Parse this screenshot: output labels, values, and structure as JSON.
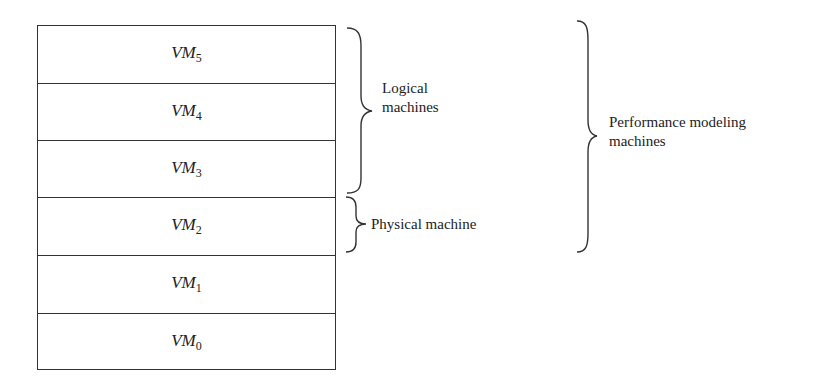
{
  "diagram": {
    "type": "layered-stack",
    "layers": [
      {
        "base": "VM",
        "sub": "5"
      },
      {
        "base": "VM",
        "sub": "4"
      },
      {
        "base": "VM",
        "sub": "3"
      },
      {
        "base": "VM",
        "sub": "2"
      },
      {
        "base": "VM",
        "sub": "1"
      },
      {
        "base": "VM",
        "sub": "0"
      }
    ],
    "groups": {
      "logical": {
        "line1": "Logical",
        "line2": "machines",
        "spans": [
          "VM5",
          "VM4",
          "VM3"
        ]
      },
      "physical": {
        "label": "Physical machine",
        "spans": [
          "VM2"
        ]
      },
      "performance": {
        "line1": "Performance modeling",
        "line2": "machines",
        "spans": [
          "VM5",
          "VM4",
          "VM3",
          "VM2"
        ]
      }
    },
    "colors": {
      "line": "#333333",
      "text": "#222222",
      "background": "#ffffff"
    }
  }
}
